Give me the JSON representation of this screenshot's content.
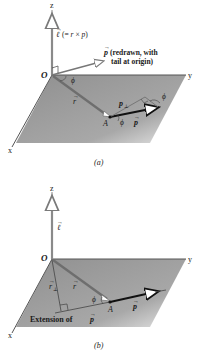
{
  "figure": {
    "panels": [
      {
        "id": "a",
        "caption": "(a)",
        "axes": {
          "z": "z",
          "y": "y",
          "x": "x",
          "origin": "O"
        },
        "labels": {
          "ell_vec": "ℓ",
          "ell_def": "(= r × p)",
          "ell_def_r": "r",
          "ell_def_x": "×",
          "ell_def_p": "p",
          "ell_def_open": "(=",
          "ell_def_close": ")",
          "p_redrawn_symbol": "p",
          "p_redrawn_line1": "(redrawn, with",
          "p_redrawn_line2": "tail at origin)",
          "angle_at_origin": "ϕ",
          "r": "r",
          "point": "A",
          "p_perp": "p",
          "p_perp_sub": "⊥",
          "angle_at_A": "ϕ",
          "angle_at_tip": "ϕ",
          "p": "p"
        }
      },
      {
        "id": "b",
        "caption": "(b)",
        "axes": {
          "z": "z",
          "y": "y",
          "x": "x",
          "origin": "O"
        },
        "labels": {
          "ell_vec": "ℓ",
          "r_perp": "r",
          "r_perp_sub": "⊥",
          "r": "r",
          "angle_at_A": "ϕ",
          "point": "A",
          "p": "p",
          "extension_text": "Extension of",
          "extension_p": "p"
        }
      }
    ],
    "colors": {
      "plane": "#9a9a9a",
      "axis": "#5a5a5a",
      "vector_r": "#6e6e6e",
      "vector_p": "#111111",
      "ell": "#8a8a8a",
      "text": "#1a1a1a"
    }
  }
}
